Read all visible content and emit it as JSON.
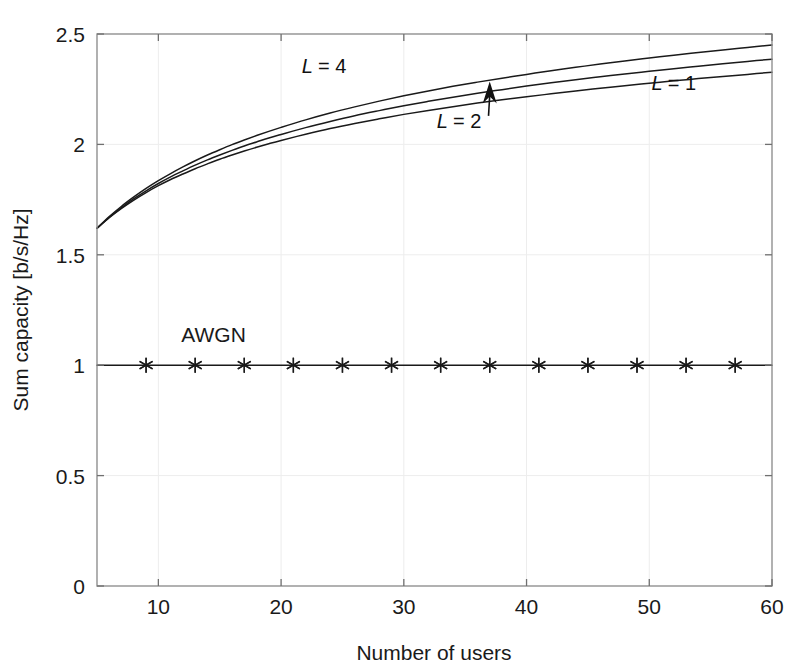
{
  "chart_data": {
    "type": "line",
    "title": "",
    "xlabel": "Number of users",
    "ylabel": "Sum capacity [b/s/Hz]",
    "xlim": [
      5,
      60
    ],
    "ylim": [
      0,
      2.5
    ],
    "xticks": [
      10,
      20,
      30,
      40,
      50,
      60
    ],
    "yticks": [
      0,
      0.5,
      1,
      1.5,
      2,
      2.5
    ],
    "xtick_labels": [
      "10",
      "20",
      "30",
      "40",
      "50",
      "60"
    ],
    "ytick_labels": [
      "0",
      "0.5",
      "1",
      "1.5",
      "2",
      "2.5"
    ],
    "grid": true,
    "grid_style": "faint dotted",
    "legend_position": "inline annotations",
    "line_color": "#1a1a1a",
    "background_color": "#ffffff",
    "axis_color": "#888888",
    "annotations": [
      {
        "text": "L = 4",
        "x": 23.5,
        "y": 2.325,
        "name": "label-L4"
      },
      {
        "text": "L = 2",
        "x": 34.5,
        "y": 2.075,
        "name": "label-L2",
        "arrow": true,
        "arrow_to_x": 37.0,
        "arrow_to_y": 2.285
      },
      {
        "text": "L = 1",
        "x": 52.0,
        "y": 2.245,
        "name": "label-L1"
      },
      {
        "text": "AWGN",
        "x": 14.5,
        "y": 1.105,
        "name": "label-awgn"
      }
    ],
    "series": [
      {
        "name": "L = 4",
        "label": "L = 4",
        "marker": "none",
        "x": [
          5,
          6,
          7,
          8,
          9,
          10,
          11,
          12,
          13,
          14,
          15,
          16,
          17,
          18,
          19,
          20,
          22,
          24,
          26,
          28,
          30,
          32,
          34,
          36,
          38,
          40,
          42,
          44,
          46,
          48,
          50,
          52,
          54,
          56,
          58,
          60
        ],
        "y": [
          1.62,
          1.668,
          1.71,
          1.748,
          1.782,
          1.813,
          1.841,
          1.866,
          1.89,
          1.912,
          1.933,
          1.952,
          1.97,
          1.987,
          2.003,
          2.018,
          2.046,
          2.072,
          2.095,
          2.116,
          2.136,
          2.154,
          2.171,
          2.187,
          2.202,
          2.216,
          2.229,
          2.242,
          2.254,
          2.266,
          2.277,
          2.288,
          2.298,
          2.308,
          2.317,
          2.327
        ]
      },
      {
        "name": "L = 2",
        "label": "L = 2",
        "marker": "none",
        "x": [
          5,
          6,
          7,
          8,
          9,
          10,
          11,
          12,
          13,
          14,
          15,
          16,
          17,
          18,
          19,
          20,
          22,
          24,
          26,
          28,
          30,
          32,
          34,
          36,
          38,
          40,
          42,
          44,
          46,
          48,
          50,
          52,
          54,
          56,
          58,
          60
        ],
        "y": [
          1.62,
          1.67,
          1.714,
          1.754,
          1.79,
          1.823,
          1.853,
          1.88,
          1.906,
          1.93,
          1.952,
          1.973,
          1.993,
          2.011,
          2.029,
          2.045,
          2.076,
          2.104,
          2.13,
          2.153,
          2.175,
          2.195,
          2.214,
          2.232,
          2.248,
          2.264,
          2.279,
          2.293,
          2.306,
          2.319,
          2.331,
          2.343,
          2.354,
          2.365,
          2.376,
          2.386
        ]
      },
      {
        "name": "L = 1",
        "label": "L = 1",
        "marker": "none",
        "x": [
          5,
          6,
          7,
          8,
          9,
          10,
          11,
          12,
          13,
          14,
          15,
          16,
          17,
          18,
          19,
          20,
          22,
          24,
          26,
          28,
          30,
          32,
          34,
          36,
          38,
          40,
          42,
          44,
          46,
          48,
          50,
          52,
          54,
          56,
          58,
          60
        ],
        "y": [
          1.62,
          1.673,
          1.72,
          1.762,
          1.801,
          1.836,
          1.868,
          1.898,
          1.926,
          1.952,
          1.976,
          1.999,
          2.02,
          2.04,
          2.059,
          2.077,
          2.111,
          2.142,
          2.17,
          2.196,
          2.22,
          2.242,
          2.263,
          2.282,
          2.3,
          2.317,
          2.334,
          2.349,
          2.364,
          2.378,
          2.391,
          2.404,
          2.416,
          2.428,
          2.439,
          2.45
        ]
      },
      {
        "name": "AWGN",
        "label": "AWGN",
        "marker": "asterisk",
        "x": [
          5,
          9,
          13,
          17,
          21,
          25,
          29,
          33,
          37,
          41,
          45,
          49,
          53,
          57,
          60
        ],
        "y": [
          1,
          1,
          1,
          1,
          1,
          1,
          1,
          1,
          1,
          1,
          1,
          1,
          1,
          1,
          1
        ],
        "marker_x": [
          9,
          13,
          17,
          21,
          25,
          29,
          33,
          37,
          41,
          45,
          49,
          53,
          57
        ],
        "marker_y": [
          1,
          1,
          1,
          1,
          1,
          1,
          1,
          1,
          1,
          1,
          1,
          1,
          1
        ]
      }
    ]
  },
  "figure": {
    "plot_left_px": 97,
    "plot_top_px": 34,
    "plot_right_px": 772,
    "plot_bottom_px": 586
  }
}
